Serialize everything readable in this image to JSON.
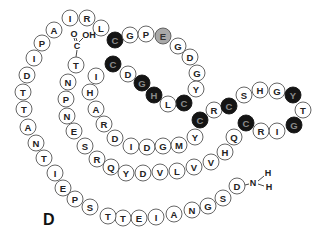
{
  "figure": {
    "panel_label": "D",
    "colors": {
      "white_fill": "#ffffff",
      "black_fill": "#141414",
      "gray_fill": "#a8a8a8",
      "outline": "#555555"
    },
    "n_terminus": {
      "atom": "N",
      "h1": "H",
      "h2": "H"
    },
    "c_terminus": {
      "carbon": "C",
      "oxygen": "O",
      "hydroxyl": "OH"
    },
    "residues": [
      {
        "aa": "D",
        "x": 237,
        "y": 186,
        "fill": "white"
      },
      {
        "aa": "S",
        "x": 223,
        "y": 198,
        "fill": "white"
      },
      {
        "aa": "G",
        "x": 208,
        "y": 206,
        "fill": "white"
      },
      {
        "aa": "N",
        "x": 192,
        "y": 210,
        "fill": "white"
      },
      {
        "aa": "A",
        "x": 174,
        "y": 214,
        "fill": "white"
      },
      {
        "aa": "I",
        "x": 156,
        "y": 217,
        "fill": "white"
      },
      {
        "aa": "E",
        "x": 139,
        "y": 218,
        "fill": "white"
      },
      {
        "aa": "T",
        "x": 123,
        "y": 218,
        "fill": "white"
      },
      {
        "aa": "T",
        "x": 108,
        "y": 216,
        "fill": "white"
      },
      {
        "aa": "S",
        "x": 90,
        "y": 207,
        "fill": "white"
      },
      {
        "aa": "P",
        "x": 75,
        "y": 199,
        "fill": "white"
      },
      {
        "aa": "E",
        "x": 63,
        "y": 188,
        "fill": "white"
      },
      {
        "aa": "I",
        "x": 55,
        "y": 173,
        "fill": "white"
      },
      {
        "aa": "T",
        "x": 44,
        "y": 158,
        "fill": "white"
      },
      {
        "aa": "N",
        "x": 36,
        "y": 143,
        "fill": "white"
      },
      {
        "aa": "A",
        "x": 28,
        "y": 127,
        "fill": "white"
      },
      {
        "aa": "T",
        "x": 24,
        "y": 109,
        "fill": "white"
      },
      {
        "aa": "T",
        "x": 23,
        "y": 92,
        "fill": "white"
      },
      {
        "aa": "D",
        "x": 27,
        "y": 75,
        "fill": "white"
      },
      {
        "aa": "I",
        "x": 34,
        "y": 58,
        "fill": "white"
      },
      {
        "aa": "P",
        "x": 42,
        "y": 43,
        "fill": "white"
      },
      {
        "aa": "A",
        "x": 54,
        "y": 30,
        "fill": "white"
      },
      {
        "aa": "I",
        "x": 70,
        "y": 18,
        "fill": "white"
      },
      {
        "aa": "R",
        "x": 87,
        "y": 18,
        "fill": "white"
      },
      {
        "aa": "L",
        "x": 101,
        "y": 28,
        "fill": "white"
      },
      {
        "aa": "C",
        "x": 115,
        "y": 40,
        "fill": "black"
      },
      {
        "aa": "G",
        "x": 130,
        "y": 35,
        "fill": "white"
      },
      {
        "aa": "P",
        "x": 146,
        "y": 34,
        "fill": "white"
      },
      {
        "aa": "E",
        "x": 163,
        "y": 36,
        "fill": "gray"
      },
      {
        "aa": "G",
        "x": 178,
        "y": 46,
        "fill": "white"
      },
      {
        "aa": "D",
        "x": 190,
        "y": 57,
        "fill": "white"
      },
      {
        "aa": "G",
        "x": 197,
        "y": 73,
        "fill": "white"
      },
      {
        "aa": "Y",
        "x": 196,
        "y": 89,
        "fill": "white"
      },
      {
        "aa": "C",
        "x": 184,
        "y": 103,
        "fill": "black"
      },
      {
        "aa": "L",
        "x": 168,
        "y": 104,
        "fill": "white"
      },
      {
        "aa": "H",
        "x": 154,
        "y": 95,
        "fill": "black"
      },
      {
        "aa": "G",
        "x": 142,
        "y": 83,
        "fill": "black"
      },
      {
        "aa": "D",
        "x": 128,
        "y": 74,
        "fill": "white"
      },
      {
        "aa": "C",
        "x": 113,
        "y": 64,
        "fill": "black"
      },
      {
        "aa": "I",
        "x": 96,
        "y": 76,
        "fill": "white"
      },
      {
        "aa": "H",
        "x": 90,
        "y": 92,
        "fill": "white"
      },
      {
        "aa": "A",
        "x": 96,
        "y": 109,
        "fill": "white"
      },
      {
        "aa": "R",
        "x": 104,
        "y": 124,
        "fill": "white"
      },
      {
        "aa": "D",
        "x": 115,
        "y": 138,
        "fill": "white"
      },
      {
        "aa": "I",
        "x": 131,
        "y": 146,
        "fill": "white"
      },
      {
        "aa": "D",
        "x": 147,
        "y": 147,
        "fill": "white"
      },
      {
        "aa": "G",
        "x": 163,
        "y": 146,
        "fill": "white"
      },
      {
        "aa": "M",
        "x": 179,
        "y": 145,
        "fill": "white"
      },
      {
        "aa": "Y",
        "x": 195,
        "y": 137,
        "fill": "white"
      },
      {
        "aa": "C",
        "x": 200,
        "y": 120,
        "fill": "black"
      },
      {
        "aa": "R",
        "x": 214,
        "y": 110,
        "fill": "white"
      },
      {
        "aa": "C",
        "x": 229,
        "y": 106,
        "fill": "black"
      },
      {
        "aa": "S",
        "x": 244,
        "y": 95,
        "fill": "white"
      },
      {
        "aa": "H",
        "x": 260,
        "y": 90,
        "fill": "white"
      },
      {
        "aa": "G",
        "x": 277,
        "y": 91,
        "fill": "white"
      },
      {
        "aa": "Y",
        "x": 293,
        "y": 95,
        "fill": "black"
      },
      {
        "aa": "T",
        "x": 303,
        "y": 110,
        "fill": "white"
      },
      {
        "aa": "G",
        "x": 294,
        "y": 125,
        "fill": "black"
      },
      {
        "aa": "I",
        "x": 277,
        "y": 131,
        "fill": "white"
      },
      {
        "aa": "R",
        "x": 261,
        "y": 131,
        "fill": "white"
      },
      {
        "aa": "C",
        "x": 246,
        "y": 123,
        "fill": "black"
      },
      {
        "aa": "Q",
        "x": 234,
        "y": 137,
        "fill": "white"
      },
      {
        "aa": "H",
        "x": 225,
        "y": 152,
        "fill": "white"
      },
      {
        "aa": "V",
        "x": 211,
        "y": 162,
        "fill": "white"
      },
      {
        "aa": "V",
        "x": 194,
        "y": 167,
        "fill": "white"
      },
      {
        "aa": "L",
        "x": 177,
        "y": 171,
        "fill": "white"
      },
      {
        "aa": "V",
        "x": 160,
        "y": 172,
        "fill": "white"
      },
      {
        "aa": "D",
        "x": 143,
        "y": 173,
        "fill": "white"
      },
      {
        "aa": "Y",
        "x": 126,
        "y": 173,
        "fill": "white"
      },
      {
        "aa": "Q",
        "x": 111,
        "y": 167,
        "fill": "white"
      },
      {
        "aa": "R",
        "x": 97,
        "y": 159,
        "fill": "white"
      },
      {
        "aa": "S",
        "x": 85,
        "y": 146,
        "fill": "white"
      },
      {
        "aa": "E",
        "x": 74,
        "y": 131,
        "fill": "white"
      },
      {
        "aa": "N",
        "x": 67,
        "y": 116,
        "fill": "white"
      },
      {
        "aa": "P",
        "x": 66,
        "y": 99,
        "fill": "white"
      },
      {
        "aa": "N",
        "x": 68,
        "y": 82,
        "fill": "white"
      },
      {
        "aa": "T",
        "x": 76,
        "y": 65,
        "fill": "white"
      }
    ]
  }
}
